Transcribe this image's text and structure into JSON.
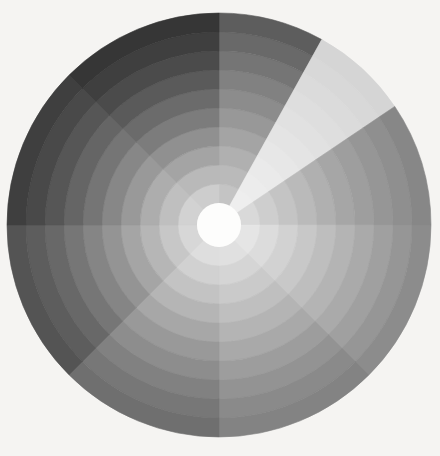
{
  "figure": {
    "background_color": "#f5f4f2",
    "width": 440,
    "height": 456
  },
  "chart_data": {
    "type": "heatmap",
    "subtype": "polar-sector-heatmap",
    "title": "",
    "subtitle": "",
    "xlabel": "",
    "ylabel": "",
    "grid": false,
    "legend": null,
    "colormap": "greys",
    "colormap_direction": "dark-low-to-light-high",
    "center_x": 219,
    "center_y": 225,
    "outer_radius": 212,
    "inner_radius": 22,
    "hole_color": "#fdfdfc",
    "theta_zero_location": "N",
    "theta_direction": "clockwise",
    "n_sectors": 8,
    "n_rings": 10,
    "sector_boundaries_deg": [
      0,
      29,
      56,
      90,
      135,
      180,
      225,
      270,
      315,
      360
    ],
    "sectors": [
      {
        "index": 0,
        "label": "S1",
        "start_deg": 0,
        "end_deg": 29
      },
      {
        "index": 1,
        "label": "S2",
        "start_deg": 29,
        "end_deg": 56
      },
      {
        "index": 2,
        "label": "S3",
        "start_deg": 56,
        "end_deg": 90
      },
      {
        "index": 3,
        "label": "S4",
        "start_deg": 90,
        "end_deg": 135
      },
      {
        "index": 4,
        "label": "S5",
        "start_deg": 135,
        "end_deg": 180
      },
      {
        "index": 5,
        "label": "S6",
        "start_deg": 180,
        "end_deg": 225
      },
      {
        "index": 6,
        "label": "S7",
        "start_deg": 225,
        "end_deg": 270
      },
      {
        "index": 7,
        "label": "S8",
        "start_deg": 270,
        "end_deg": 315
      },
      {
        "index": 8,
        "label": "S9",
        "start_deg": 315,
        "end_deg": 360
      }
    ],
    "ring_boundaries_r": [
      22,
      41,
      60,
      79,
      98,
      117,
      136,
      155,
      174,
      193,
      212
    ],
    "ring_labels": [
      "r1",
      "r2",
      "r3",
      "r4",
      "r5",
      "r6",
      "r7",
      "r8",
      "r9",
      "r10"
    ],
    "vmin": 0.0,
    "vmax": 1.0,
    "values": [
      [
        0.76,
        0.72,
        0.68,
        0.63,
        0.58,
        0.53,
        0.48,
        0.43,
        0.38,
        0.33
      ],
      [
        0.93,
        0.92,
        0.91,
        0.9,
        0.89,
        0.88,
        0.87,
        0.86,
        0.85,
        0.84
      ],
      [
        0.85,
        0.8,
        0.76,
        0.72,
        0.68,
        0.64,
        0.61,
        0.58,
        0.55,
        0.52
      ],
      [
        0.9,
        0.86,
        0.82,
        0.78,
        0.74,
        0.7,
        0.66,
        0.62,
        0.58,
        0.54
      ],
      [
        0.88,
        0.83,
        0.78,
        0.73,
        0.68,
        0.63,
        0.58,
        0.54,
        0.5,
        0.47
      ],
      [
        0.87,
        0.81,
        0.75,
        0.69,
        0.63,
        0.57,
        0.52,
        0.47,
        0.43,
        0.4
      ],
      [
        0.84,
        0.77,
        0.7,
        0.63,
        0.56,
        0.5,
        0.44,
        0.39,
        0.35,
        0.31
      ],
      [
        0.82,
        0.74,
        0.66,
        0.58,
        0.51,
        0.44,
        0.38,
        0.32,
        0.27,
        0.23
      ],
      [
        0.8,
        0.71,
        0.63,
        0.55,
        0.47,
        0.4,
        0.34,
        0.28,
        0.23,
        0.19
      ]
    ],
    "cell_colors": [
      [
        "#c4c4c4",
        "#bababa",
        "#b0b0b0",
        "#a4a4a4",
        "#989898",
        "#8c8c8c",
        "#818181",
        "#757575",
        "#696969",
        "#5d5d5d"
      ],
      [
        "#eeeeee",
        "#ececec",
        "#eaeaea",
        "#e7e7e7",
        "#e4e4e4",
        "#e1e1e1",
        "#dedede",
        "#dbdbdb",
        "#d8d8d8",
        "#d5d5d5"
      ],
      [
        "#d9d9d9",
        "#cecece",
        "#c4c4c4",
        "#bababa",
        "#b0b0b0",
        "#a6a6a6",
        "#9e9e9e",
        "#969696",
        "#8f8f8f",
        "#878787"
      ],
      [
        "#e5e5e5",
        "#dcdcdc",
        "#d2d2d2",
        "#c8c8c8",
        "#bebebe",
        "#b4b4b4",
        "#aaaaaa",
        "#a0a0a0",
        "#969696",
        "#8c8c8c"
      ],
      [
        "#e0e0e0",
        "#d5d5d5",
        "#cacaca",
        "#bfbfbf",
        "#b4b4b4",
        "#a9a9a9",
        "#9d9d9d",
        "#939393",
        "#8a8a8a",
        "#838383"
      ],
      [
        "#dedede",
        "#d1d1d1",
        "#c3c3c3",
        "#b5b5b5",
        "#a7a7a7",
        "#999999",
        "#8d8d8d",
        "#818181",
        "#777777",
        "#6f6f6f"
      ],
      [
        "#d7d7d7",
        "#c7c7c7",
        "#b6b6b6",
        "#a5a5a5",
        "#949494",
        "#858585",
        "#767676",
        "#686868",
        "#5d5d5d",
        "#545454"
      ],
      [
        "#d2d2d2",
        "#bfbfbf",
        "#adadad",
        "#999999",
        "#878787",
        "#757575",
        "#656565",
        "#565656",
        "#494949",
        "#3f3f3f"
      ],
      [
        "#cdcdcd",
        "#b9b9b9",
        "#a4a4a4",
        "#909090",
        "#7c7c7c",
        "#6b6b6b",
        "#5a5a5a",
        "#4b4b4b",
        "#3f3f3f",
        "#363636"
      ]
    ],
    "annotations": []
  }
}
